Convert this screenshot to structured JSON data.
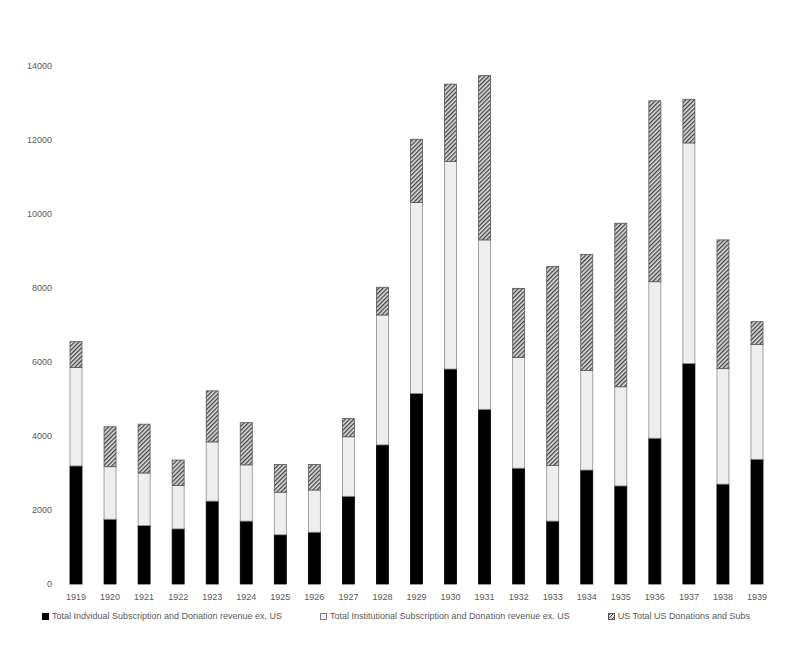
{
  "chart_data": {
    "type": "bar",
    "stacked": true,
    "title": "",
    "xlabel": "",
    "ylabel": "",
    "ylim": [
      0,
      14000
    ],
    "yticks": [
      0,
      2000,
      4000,
      6000,
      8000,
      10000,
      12000,
      14000
    ],
    "grid": false,
    "legend_position": "bottom",
    "categories": [
      "1919",
      "1920",
      "1921",
      "1922",
      "1923",
      "1924",
      "1925",
      "1926",
      "1927",
      "1928",
      "1929",
      "1930",
      "1931",
      "1932",
      "1933",
      "1934",
      "1935",
      "1936",
      "1937",
      "1938",
      "1939"
    ],
    "series": [
      {
        "name": "Total Indvidual Subscription and Donation revenue ex. US",
        "fill": "solid-black",
        "values": [
          3190,
          1750,
          1580,
          1490,
          2240,
          1700,
          1330,
          1400,
          2370,
          3760,
          5150,
          5810,
          4720,
          3130,
          1700,
          3080,
          2650,
          3940,
          5960,
          2700,
          3370
        ]
      },
      {
        "name": "Total Institutional Subscription and Donation revenue ex. US",
        "fill": "light-grey",
        "values": [
          2660,
          1420,
          1420,
          1170,
          1600,
          1520,
          1150,
          1140,
          1610,
          3510,
          5160,
          5610,
          4580,
          2990,
          1500,
          2690,
          2680,
          4230,
          5960,
          3120,
          3100
        ]
      },
      {
        "name": "US Total US Donations and Subs",
        "fill": "diagonal-hatch",
        "values": [
          700,
          1080,
          1320,
          690,
          1380,
          1140,
          750,
          690,
          490,
          750,
          1710,
          2090,
          4440,
          1870,
          5380,
          3140,
          4420,
          4890,
          1180,
          3480,
          620
        ]
      }
    ],
    "totals": [
      6550,
      4250,
      4320,
      3350,
      5220,
      4360,
      3230,
      3230,
      4470,
      8020,
      12020,
      13510,
      13740,
      7990,
      8580,
      8910,
      9750,
      13060,
      13100,
      9300,
      7090
    ]
  },
  "colors": {
    "series1": "#000000",
    "series2": "#eeeeee",
    "series3_hatch_dark": "#444444",
    "series3_hatch_light": "#dddddd",
    "axis_text": "#595959"
  },
  "legend": {
    "items": [
      {
        "label": "Total Indvidual Subscription and Donation revenue ex. US"
      },
      {
        "label": "Total Institutional Subscription and Donation revenue ex. US"
      },
      {
        "label": "US Total US Donations and Subs"
      }
    ]
  }
}
